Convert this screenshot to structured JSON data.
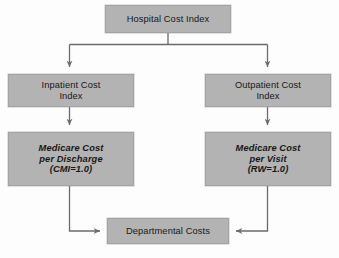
{
  "diagram": {
    "title": "Hospital Cost Index",
    "background_color": "#fdfdfd",
    "node_fill_color": "#b3b3b3",
    "node_border_color": "#a3a3a3",
    "connector_color": "#6b6b6b",
    "text_color": "#171717",
    "nodes": {
      "hospital_cost_index": {
        "label": "Hospital Cost Index",
        "lines": [
          "Hospital Cost Index"
        ]
      },
      "inpatient_cost_index": {
        "label": "Inpatient Cost Index",
        "lines": [
          "Inpatient Cost",
          "Index"
        ]
      },
      "outpatient_cost_index": {
        "label": "Outpatient Cost Index",
        "lines": [
          "Outpatient Cost",
          "Index"
        ]
      },
      "medicare_cost_per_discharge": {
        "label": "Medicare Cost per Discharge (CMI=1.0)",
        "lines": [
          "Medicare Cost",
          "per Discharge",
          "(CMI=1.0)"
        ]
      },
      "medicare_cost_per_visit": {
        "label": "Medicare Cost per Visit (RW=1.0)",
        "lines": [
          "Medicare Cost",
          "per Visit",
          "(RW=1.0)"
        ]
      },
      "departmental_costs": {
        "label": "Departmental Costs",
        "lines": [
          "Departmental Costs"
        ]
      }
    },
    "edges": [
      {
        "name": "hospital-to-inpatient",
        "from": "hospital_cost_index",
        "to": "inpatient_cost_index",
        "style": "elbow-down-left-arrow"
      },
      {
        "name": "hospital-to-outpatient",
        "from": "hospital_cost_index",
        "to": "outpatient_cost_index",
        "style": "elbow-down-right-arrow"
      },
      {
        "name": "inpatient-to-medicare-discharge",
        "from": "inpatient_cost_index",
        "to": "medicare_cost_per_discharge",
        "style": "straight-down-arrow"
      },
      {
        "name": "outpatient-to-medicare-visit",
        "from": "outpatient_cost_index",
        "to": "medicare_cost_per_visit",
        "style": "straight-down-arrow"
      },
      {
        "name": "medicare-discharge-to-departmental",
        "from": "medicare_cost_per_discharge",
        "to": "departmental_costs",
        "style": "elbow-down-right-arrow"
      },
      {
        "name": "medicare-visit-to-departmental",
        "from": "medicare_cost_per_visit",
        "to": "departmental_costs",
        "style": "elbow-down-left-arrow"
      }
    ]
  }
}
